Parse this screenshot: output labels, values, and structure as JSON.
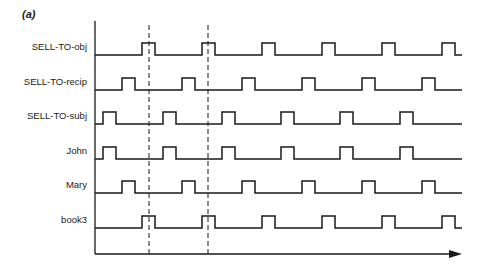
{
  "panel_label": "(a)",
  "axis": {
    "origin_x": 95,
    "top_y": 25,
    "bottom_y": 254,
    "end_x": 462
  },
  "dashed_markers": [
    149,
    208
  ],
  "pulse_width": 13,
  "pulse_height": 12,
  "signals": [
    {
      "label": "SELL-TO-obj",
      "baseline_y": 55,
      "pulses": [
        142,
        202,
        262,
        322,
        382,
        442
      ]
    },
    {
      "label": "SELL-TO-recip",
      "baseline_y": 90,
      "pulses": [
        122,
        182,
        242,
        302,
        362,
        422
      ]
    },
    {
      "label": "SELL-TO-subj",
      "baseline_y": 124,
      "pulses": [
        103,
        163,
        222,
        281,
        340,
        400
      ]
    },
    {
      "label": "John",
      "baseline_y": 159,
      "pulses": [
        103,
        163,
        222,
        281,
        340,
        400
      ]
    },
    {
      "label": "Mary",
      "baseline_y": 193,
      "pulses": [
        122,
        182,
        242,
        302,
        362,
        422
      ]
    },
    {
      "label": "book3",
      "baseline_y": 228,
      "pulses": [
        142,
        202,
        262,
        322,
        382,
        442
      ]
    }
  ],
  "colors": {
    "line": "#1a1a1a"
  }
}
